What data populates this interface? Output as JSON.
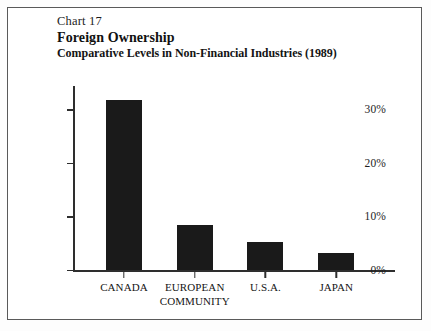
{
  "figure": {
    "chart_number": "Chart 17",
    "title": "Foreign Ownership",
    "subtitle": "Comparative Levels in Non-Financial Industries (1989)"
  },
  "chart_data": {
    "type": "bar",
    "title": "Foreign Ownership",
    "subtitle": "Comparative Levels in Non-Financial Industries (1989)",
    "chart_number": "Chart 17",
    "categories": [
      "CANADA",
      "EUROPEAN COMMUNITY",
      "U.S.A.",
      "JAPAN"
    ],
    "values": [
      31.8,
      8.5,
      5.3,
      3.2
    ],
    "xlabel": "",
    "ylabel": "",
    "ylim": [
      0,
      34
    ],
    "yticks": [
      0,
      10,
      20,
      30
    ],
    "ytick_labels": [
      "0%",
      "10%",
      "20%",
      "30%"
    ],
    "grid": false,
    "legend": false,
    "bar_color": "#1a1a1a",
    "axis_color": "#2e2e2e",
    "background_color": "#ffffff"
  },
  "axis": {
    "ticks": [
      {
        "label": "0%",
        "value": 0
      },
      {
        "label": "10%",
        "value": 10
      },
      {
        "label": "20%",
        "value": 20
      },
      {
        "label": "30%",
        "value": 30
      }
    ]
  },
  "bars": [
    {
      "label": "CANADA",
      "value": 31.8
    },
    {
      "label": "EUROPEAN\nCOMMUNITY",
      "value": 8.5
    },
    {
      "label": "U.S.A.",
      "value": 5.3
    },
    {
      "label": "JAPAN",
      "value": 3.2
    }
  ]
}
